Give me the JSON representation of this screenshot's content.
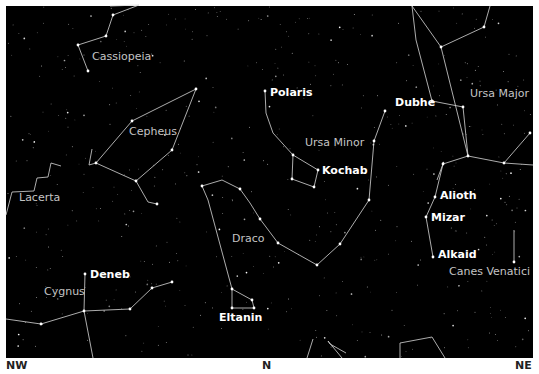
{
  "map": {
    "frame": {
      "x": 6,
      "y": 6,
      "width": 527,
      "height": 352
    },
    "colors": {
      "sky": "#000000",
      "lines": "#d8d8d8",
      "star": "#ffffff",
      "constellation_label": "#c4c4c4",
      "star_label": "#ffffff",
      "direction_label": "#222222"
    },
    "directions": [
      {
        "label": "NW",
        "x": 6
      },
      {
        "label": "N",
        "x": 262
      },
      {
        "label": "NE",
        "x": 515
      }
    ],
    "constellation_labels": [
      {
        "text": "Cassiopeia",
        "x": 92,
        "y": 60
      },
      {
        "text": "Cepheus",
        "x": 129,
        "y": 135
      },
      {
        "text": "Ursa Minor",
        "x": 305,
        "y": 146
      },
      {
        "text": "Ursa Major",
        "x": 470,
        "y": 97
      },
      {
        "text": "Lacerta",
        "x": 19,
        "y": 201
      },
      {
        "text": "Draco",
        "x": 232,
        "y": 242
      },
      {
        "text": "Cygnus",
        "x": 44,
        "y": 295
      },
      {
        "text": "Canes Venatici",
        "x": 449,
        "y": 275
      }
    ],
    "star_labels": [
      {
        "text": "Polaris",
        "x": 270,
        "y": 96
      },
      {
        "text": "Dubhe",
        "x": 395,
        "y": 106
      },
      {
        "text": "Kochab",
        "x": 322,
        "y": 174
      },
      {
        "text": "Alioth",
        "x": 440,
        "y": 199
      },
      {
        "text": "Mizar",
        "x": 431,
        "y": 221
      },
      {
        "text": "Alkaid",
        "x": 438,
        "y": 258
      },
      {
        "text": "Deneb",
        "x": 90,
        "y": 278
      },
      {
        "text": "Eltanin",
        "x": 219,
        "y": 321
      }
    ],
    "constellations": [
      {
        "name": "Cassiopeia",
        "points": [
          [
            110,
            6
          ],
          [
            139,
            5
          ],
          [
            113,
            15
          ],
          [
            106,
            36
          ],
          [
            78,
            45
          ],
          [
            88,
            71
          ]
        ]
      },
      {
        "name": "Cepheus",
        "points": [
          [
            132,
            121
          ],
          [
            196,
            89
          ],
          [
            172,
            150
          ],
          [
            136,
            181
          ],
          [
            96,
            163
          ],
          [
            132,
            121
          ]
        ]
      },
      {
        "name": "Cepheus-tail",
        "points": [
          [
            136,
            181
          ],
          [
            148,
            202
          ],
          [
            157,
            204
          ]
        ]
      },
      {
        "name": "Cepheus-hook",
        "points": [
          [
            96,
            163
          ],
          [
            89,
            165
          ],
          [
            92,
            149
          ]
        ]
      },
      {
        "name": "Ursa Minor",
        "points": [
          [
            265,
            91
          ],
          [
            266,
            113
          ],
          [
            273,
            133
          ],
          [
            293,
            155
          ],
          [
            318,
            170
          ],
          [
            314,
            187
          ],
          [
            292,
            179
          ],
          [
            293,
            155
          ]
        ]
      },
      {
        "name": "Ursa Minor-Draco",
        "points": [
          [
            385,
            111
          ],
          [
            374,
            141
          ],
          [
            369,
            200
          ],
          [
            340,
            244
          ],
          [
            317,
            265
          ],
          [
            278,
            243
          ],
          [
            260,
            219
          ],
          [
            250,
            203
          ],
          [
            240,
            189
          ],
          [
            222,
            180
          ],
          [
            202,
            186
          ],
          [
            208,
            200
          ],
          [
            232,
            289
          ],
          [
            252,
            300
          ],
          [
            254,
            308
          ],
          [
            232,
            308
          ],
          [
            232,
            289
          ]
        ]
      },
      {
        "name": "Ursa Major",
        "points": [
          [
            412,
            6
          ],
          [
            441,
            47
          ],
          [
            468,
            156
          ],
          [
            443,
            164
          ],
          [
            435,
            197
          ],
          [
            426,
            217
          ],
          [
            433,
            257
          ]
        ]
      },
      {
        "name": "Ursa Major-bowl",
        "points": [
          [
            441,
            47
          ],
          [
            484,
            27
          ],
          [
            490,
            6
          ]
        ]
      },
      {
        "name": "Ursa Major-west",
        "points": [
          [
            412,
            6
          ],
          [
            416,
            40
          ],
          [
            432,
            101
          ],
          [
            463,
            107
          ],
          [
            468,
            156
          ]
        ]
      },
      {
        "name": "Ursa Major-east",
        "points": [
          [
            468,
            156
          ],
          [
            504,
            163
          ],
          [
            533,
            165
          ]
        ]
      },
      {
        "name": "Ursa Major-leg",
        "points": [
          [
            504,
            163
          ],
          [
            530,
            133
          ]
        ]
      },
      {
        "name": "Ursa Major-hindleg",
        "points": [
          [
            443,
            164
          ],
          [
            437,
            180
          ]
        ]
      },
      {
        "name": "Canes Venatici",
        "points": [
          [
            514,
            230
          ],
          [
            514,
            262
          ]
        ]
      },
      {
        "name": "Lacerta",
        "points": [
          [
            6,
            215
          ],
          [
            12,
            192
          ],
          [
            34,
            191
          ],
          [
            37,
            178
          ],
          [
            48,
            177
          ],
          [
            51,
            163
          ],
          [
            61,
            166
          ]
        ]
      },
      {
        "name": "Cygnus",
        "points": [
          [
            6,
            319
          ],
          [
            41,
            324
          ],
          [
            84,
            311
          ],
          [
            130,
            309
          ],
          [
            152,
            288
          ],
          [
            172,
            282
          ]
        ]
      },
      {
        "name": "Cygnus-neck",
        "points": [
          [
            85,
            274
          ],
          [
            84,
            311
          ],
          [
            93,
            358
          ]
        ]
      },
      {
        "name": "Bottom-1",
        "points": [
          [
            307,
            358
          ],
          [
            313,
            339
          ]
        ]
      },
      {
        "name": "Bottom-2",
        "points": [
          [
            342,
            358
          ],
          [
            328,
            341
          ],
          [
            330,
            344
          ],
          [
            346,
            353
          ]
        ]
      },
      {
        "name": "Bottom-3",
        "points": [
          [
            400,
            358
          ],
          [
            400,
            343
          ],
          [
            432,
            337
          ],
          [
            445,
            358
          ]
        ]
      }
    ],
    "named_stars": [
      [
        88,
        71
      ],
      [
        106,
        36
      ],
      [
        78,
        45
      ],
      [
        113,
        15
      ],
      [
        196,
        89
      ],
      [
        132,
        121
      ],
      [
        172,
        150
      ],
      [
        136,
        181
      ],
      [
        96,
        163
      ],
      [
        157,
        204
      ],
      [
        265,
        91
      ],
      [
        318,
        170
      ],
      [
        314,
        187
      ],
      [
        293,
        155
      ],
      [
        292,
        179
      ],
      [
        385,
        111
      ],
      [
        374,
        141
      ],
      [
        369,
        200
      ],
      [
        340,
        244
      ],
      [
        317,
        265
      ],
      [
        278,
        243
      ],
      [
        260,
        219
      ],
      [
        240,
        189
      ],
      [
        202,
        186
      ],
      [
        232,
        289
      ],
      [
        252,
        300
      ],
      [
        254,
        308
      ],
      [
        232,
        308
      ],
      [
        432,
        101
      ],
      [
        463,
        107
      ],
      [
        441,
        47
      ],
      [
        484,
        27
      ],
      [
        468,
        156
      ],
      [
        443,
        164
      ],
      [
        435,
        197
      ],
      [
        426,
        217
      ],
      [
        433,
        257
      ],
      [
        504,
        163
      ],
      [
        530,
        133
      ],
      [
        514,
        262
      ],
      [
        85,
        274
      ],
      [
        84,
        311
      ],
      [
        41,
        324
      ],
      [
        130,
        309
      ],
      [
        152,
        288
      ],
      [
        172,
        282
      ]
    ]
  }
}
